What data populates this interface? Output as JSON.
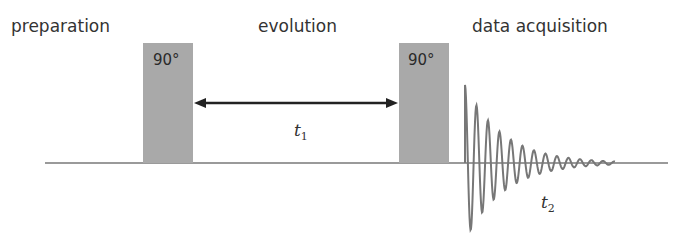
{
  "diagram": {
    "stages": [
      {
        "label": "preparation"
      },
      {
        "label": "evolution"
      },
      {
        "label": "data acquisition"
      }
    ],
    "pulses": [
      {
        "label": "90°"
      },
      {
        "label": "90°"
      }
    ],
    "evolution_time": {
      "symbol": "t",
      "subscript": "1"
    },
    "acquisition_time": {
      "symbol": "t",
      "subscript": "2"
    },
    "colors": {
      "pulse": "#a9a9a9",
      "baseline": "#9a9a9a",
      "fid": "#777777",
      "arrow": "#222222",
      "text": "#333333"
    }
  }
}
